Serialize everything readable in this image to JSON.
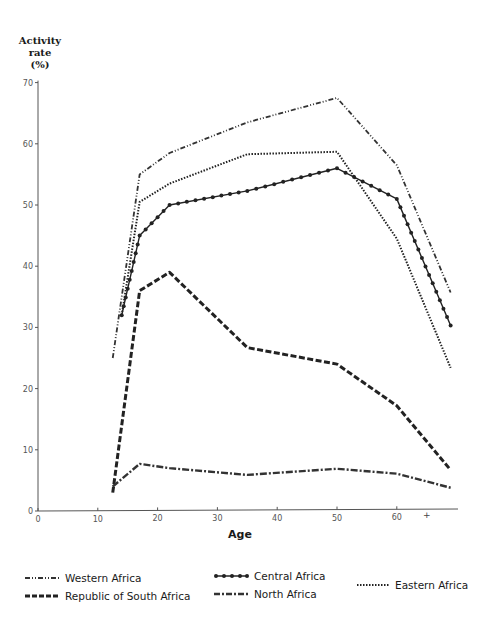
{
  "chart_data": {
    "type": "line",
    "title": "",
    "xlabel": "Age",
    "ylabel": "Activity rate (%)",
    "ylabel_lines": [
      "Activity",
      "rate",
      "(%)"
    ],
    "xlim": [
      0,
      70
    ],
    "ylim": [
      0,
      70
    ],
    "x_ticks": [
      0,
      10,
      20,
      30,
      40,
      50,
      60
    ],
    "x_tick_labels": [
      "0",
      "10",
      "20",
      "30",
      "40",
      "50",
      "60"
    ],
    "x_extra_mark": "+",
    "y_ticks": [
      0,
      10,
      20,
      30,
      40,
      50,
      60,
      70
    ],
    "y_tick_labels": [
      "0",
      "10",
      "20",
      "30",
      "40",
      "50",
      "60",
      "70"
    ],
    "grid": false,
    "legend_position": "bottom",
    "series": [
      {
        "name": "Western Africa",
        "style": "dash-dot-dot",
        "x": [
          12.5,
          17,
          22,
          35,
          50,
          60,
          69
        ],
        "y": [
          25,
          55,
          58.5,
          63.5,
          67.5,
          56.5,
          35.7
        ]
      },
      {
        "name": "Central Africa",
        "style": "solid-dots",
        "x": [
          14,
          17,
          22,
          35,
          50,
          60,
          69
        ],
        "y": [
          32,
          45,
          50,
          52.3,
          56,
          51,
          30.3
        ]
      },
      {
        "name": "Eastern Africa",
        "style": "dotted",
        "x": [
          14,
          17,
          22,
          35,
          50,
          60,
          69
        ],
        "y": [
          32,
          50.5,
          53.5,
          58.3,
          58.7,
          44.5,
          23.4
        ]
      },
      {
        "name": "Republic of South Africa",
        "style": "dashed",
        "x": [
          12.5,
          17,
          22,
          35,
          50,
          60,
          69
        ],
        "y": [
          3,
          36,
          39,
          26.7,
          24,
          17.2,
          6.7
        ]
      },
      {
        "name": "North Africa",
        "style": "dash-dot",
        "x": [
          12.5,
          17,
          22,
          35,
          50,
          60,
          69
        ],
        "y": [
          4,
          7.7,
          7,
          5.9,
          6.9,
          6.1,
          3.8
        ]
      }
    ]
  },
  "legend": [
    {
      "label": "Western Africa",
      "style": "dash-dot-dot"
    },
    {
      "label": "Central Africa",
      "style": "solid-dots"
    },
    {
      "label": "Eastern Africa",
      "style": "dotted"
    },
    {
      "label": "Republic of South Africa",
      "style": "dashed"
    },
    {
      "label": "North Africa",
      "style": "dash-dot"
    }
  ]
}
